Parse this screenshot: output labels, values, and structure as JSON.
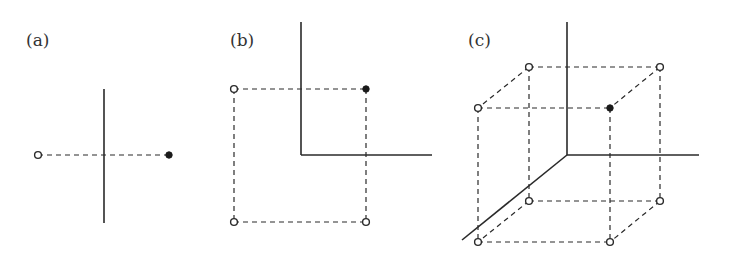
{
  "figure": {
    "panels": [
      {
        "id": "a",
        "label": "(a)",
        "dimension": 1,
        "axes": [
          {
            "x1": 104,
            "y1": 89,
            "x2": 104,
            "y2": 223
          }
        ],
        "edges": [
          {
            "x1": 38,
            "y1": 155,
            "x2": 169,
            "y2": 155
          }
        ],
        "vertices": [
          {
            "x": 38,
            "y": 155,
            "filled": false
          },
          {
            "x": 169,
            "y": 155,
            "filled": true
          }
        ]
      },
      {
        "id": "b",
        "label": "(b)",
        "dimension": 2,
        "axes": [
          {
            "x1": 301,
            "y1": 22,
            "x2": 301,
            "y2": 155
          },
          {
            "x1": 301,
            "y1": 155,
            "x2": 432,
            "y2": 155
          }
        ],
        "edges": [
          {
            "x1": 234,
            "y1": 89,
            "x2": 366,
            "y2": 89
          },
          {
            "x1": 234,
            "y1": 222,
            "x2": 366,
            "y2": 222
          },
          {
            "x1": 234,
            "y1": 89,
            "x2": 234,
            "y2": 222
          },
          {
            "x1": 366,
            "y1": 89,
            "x2": 366,
            "y2": 222
          }
        ],
        "vertices": [
          {
            "x": 234,
            "y": 89,
            "filled": false
          },
          {
            "x": 366,
            "y": 89,
            "filled": true
          },
          {
            "x": 234,
            "y": 222,
            "filled": false
          },
          {
            "x": 366,
            "y": 222,
            "filled": false
          }
        ]
      },
      {
        "id": "c",
        "label": "(c)",
        "dimension": 3,
        "axes": [
          {
            "x1": 567,
            "y1": 22,
            "x2": 567,
            "y2": 155
          },
          {
            "x1": 567,
            "y1": 155,
            "x2": 699,
            "y2": 155
          },
          {
            "x1": 567,
            "y1": 155,
            "x2": 462,
            "y2": 240
          }
        ],
        "edges": [
          {
            "x1": 529,
            "y1": 67,
            "x2": 660,
            "y2": 67
          },
          {
            "x1": 478,
            "y1": 108,
            "x2": 610,
            "y2": 108
          },
          {
            "x1": 529,
            "y1": 201,
            "x2": 660,
            "y2": 201
          },
          {
            "x1": 478,
            "y1": 242,
            "x2": 610,
            "y2": 242
          },
          {
            "x1": 529,
            "y1": 67,
            "x2": 529,
            "y2": 201
          },
          {
            "x1": 660,
            "y1": 67,
            "x2": 660,
            "y2": 201
          },
          {
            "x1": 478,
            "y1": 108,
            "x2": 478,
            "y2": 242
          },
          {
            "x1": 610,
            "y1": 108,
            "x2": 610,
            "y2": 242
          },
          {
            "x1": 529,
            "y1": 67,
            "x2": 478,
            "y2": 108
          },
          {
            "x1": 660,
            "y1": 67,
            "x2": 610,
            "y2": 108
          },
          {
            "x1": 529,
            "y1": 201,
            "x2": 478,
            "y2": 242
          },
          {
            "x1": 660,
            "y1": 201,
            "x2": 610,
            "y2": 242
          }
        ],
        "vertices": [
          {
            "x": 529,
            "y": 67,
            "filled": false
          },
          {
            "x": 660,
            "y": 67,
            "filled": false
          },
          {
            "x": 478,
            "y": 108,
            "filled": false
          },
          {
            "x": 610,
            "y": 108,
            "filled": true
          },
          {
            "x": 529,
            "y": 201,
            "filled": false
          },
          {
            "x": 660,
            "y": 201,
            "filled": false
          },
          {
            "x": 478,
            "y": 242,
            "filled": false
          },
          {
            "x": 610,
            "y": 242,
            "filled": false
          }
        ]
      }
    ],
    "label_positions": [
      {
        "x": 26,
        "y": 46
      },
      {
        "x": 230,
        "y": 46
      },
      {
        "x": 468,
        "y": 46
      }
    ]
  }
}
